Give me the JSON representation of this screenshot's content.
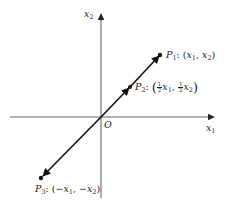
{
  "diagram": {
    "axes": {
      "x1": {
        "label": "x",
        "sub": "1"
      },
      "x2": {
        "label": "x",
        "sub": "2"
      },
      "origin": "O"
    },
    "points": {
      "p1": {
        "name": "P",
        "sub": "1",
        "sep": ": (",
        "c1": "x",
        "c1sub": "1",
        "comma": ", ",
        "c2": "x",
        "c2sub": "2",
        "close": ")"
      },
      "p2": {
        "name": "P",
        "sub": "2",
        "sep": ": ",
        "open": "(",
        "frac_num": "1",
        "frac_den": "2",
        "c1": "x",
        "c1sub": "1",
        "comma": ", ",
        "c2": "x",
        "c2sub": "2",
        "close": ")"
      },
      "p3": {
        "name": "P",
        "sub": "3",
        "sep": ": (",
        "c1": "−x",
        "c1sub": "1",
        "comma": ", ",
        "c2": "−x",
        "c2sub": "2",
        "close": ")"
      }
    },
    "colors": {
      "line": "#111111",
      "axis": "#555555",
      "text": "#1a1a1a"
    }
  }
}
